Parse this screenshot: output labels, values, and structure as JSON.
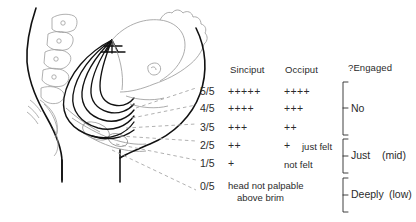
{
  "figure": {
    "title_present": false,
    "illustration": {
      "name": "fetal-head-descent-pelvis-sagittal",
      "description": "Sagittal section of maternal abdomen and pelvis with fetal head shown as nested arcs indicating fifths palpable above the brim"
    }
  },
  "table": {
    "headers": {
      "fifths": "",
      "sinciput": "Sinciput",
      "occiput": "Occiput",
      "engaged": "?Engaged"
    },
    "rows": [
      {
        "fifths": "5/5",
        "sinciput": "+++++",
        "occiput": "++++",
        "note": ""
      },
      {
        "fifths": "4/5",
        "sinciput": "++++",
        "occiput": "+++",
        "note": ""
      },
      {
        "fifths": "3/5",
        "sinciput": "+++",
        "occiput": "++",
        "note": ""
      },
      {
        "fifths": "2/5",
        "sinciput": "++",
        "occiput": "+",
        "note": "just felt"
      },
      {
        "fifths": "1/5",
        "sinciput": "+",
        "occiput": "",
        "note": "not felt"
      },
      {
        "fifths": "0/5",
        "sinciput": "",
        "occiput": "",
        "note": ""
      }
    ],
    "bottom_text_line1": "head not palpable",
    "bottom_text_line2": "above brim",
    "groups": [
      {
        "label": "No",
        "qualifier": ""
      },
      {
        "label": "Just",
        "qualifier": "(mid)"
      },
      {
        "label": "Deeply",
        "qualifier": "(low)"
      }
    ]
  },
  "colors": {
    "ink": "#2b2b2b",
    "bold_outline": "#111111",
    "light_anatomy": "#9a9a9a",
    "dashed_leader": "#a8a8a8",
    "background": "#ffffff"
  }
}
